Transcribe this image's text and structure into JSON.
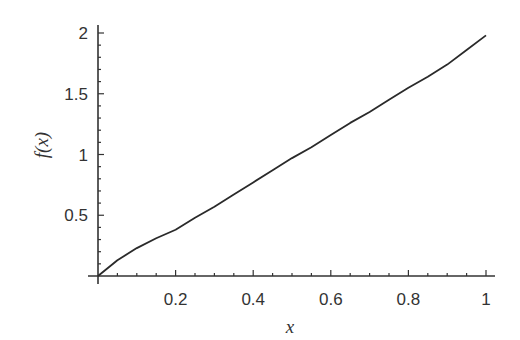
{
  "chart_data": {
    "type": "line",
    "title": "",
    "xlabel": "x",
    "ylabel": "f(x)",
    "xlim": [
      0,
      1
    ],
    "ylim": [
      0,
      2
    ],
    "grid": false,
    "legend": null,
    "x_ticks": [
      0.2,
      0.4,
      0.6,
      0.8,
      1
    ],
    "x_tick_labels": [
      "0.2",
      "0.4",
      "0.6",
      "0.8",
      "1"
    ],
    "y_ticks": [
      0.5,
      1,
      1.5,
      2
    ],
    "y_tick_labels": [
      "0.5",
      "1",
      "1.5",
      "2"
    ],
    "series": [
      {
        "name": "f(x)",
        "color": "#2a2a2a",
        "x": [
          0,
          0.05,
          0.1,
          0.15,
          0.2,
          0.25,
          0.3,
          0.35,
          0.4,
          0.45,
          0.5,
          0.55,
          0.6,
          0.65,
          0.7,
          0.75,
          0.8,
          0.85,
          0.9,
          0.95,
          1.0
        ],
        "y": [
          0,
          0.13,
          0.23,
          0.31,
          0.38,
          0.48,
          0.57,
          0.67,
          0.77,
          0.87,
          0.97,
          1.06,
          1.16,
          1.26,
          1.35,
          1.45,
          1.55,
          1.64,
          1.74,
          1.86,
          1.98
        ]
      }
    ]
  },
  "labels": {
    "x_axis": "x",
    "y_axis": "f(x)"
  }
}
